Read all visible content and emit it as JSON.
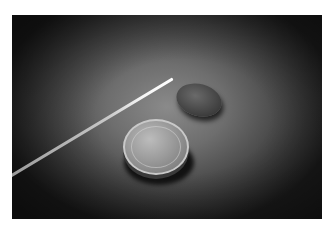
{
  "image": {
    "description": "Grayscale photograph of two coins and a thin glass fiber on a dark vignetted surface",
    "colors": {
      "border": "#ffffff",
      "background_center": "#8a8a8a",
      "background_edge": "#1c1c1c",
      "highlight": "#ffffff"
    },
    "objects": [
      {
        "name": "glass-fiber",
        "kind": "rod"
      },
      {
        "name": "coin-front",
        "kind": "coin"
      },
      {
        "name": "coin-back",
        "kind": "coin"
      }
    ]
  }
}
